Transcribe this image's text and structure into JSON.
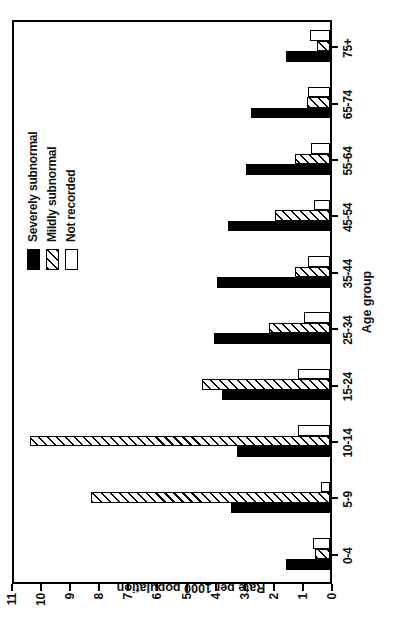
{
  "chart_data": {
    "type": "bar",
    "orientation": "vertical-drawn-rotated",
    "title": "",
    "xlabel": "Age group",
    "ylabel": "Rate per 1000 population",
    "categories": [
      "0-4",
      "5-9",
      "10-14",
      "15-24",
      "25-34",
      "35-44",
      "45-54",
      "55-64",
      "65-74",
      "75+"
    ],
    "ylim": [
      0,
      11
    ],
    "yticks": [
      0,
      1,
      2,
      3,
      4,
      5,
      6,
      7,
      8,
      9,
      10,
      11
    ],
    "ytick_labels": [
      "0",
      "1",
      "2",
      "3",
      "4",
      "5",
      "6",
      "7",
      "8",
      "9",
      "10",
      "11"
    ],
    "grid": false,
    "legend_position": "top-right inside plot",
    "series": [
      {
        "name": "Severely subnormal",
        "fill": "solid-black",
        "color": "#000000",
        "values": [
          1.5,
          3.4,
          3.2,
          3.7,
          4.0,
          3.9,
          3.5,
          2.9,
          2.7,
          1.5
        ]
      },
      {
        "name": "Mildly subnormal",
        "fill": "diagonal-hatch",
        "color": "#ffffff",
        "values": [
          0.5,
          8.2,
          10.3,
          4.4,
          2.1,
          1.2,
          1.9,
          1.2,
          0.8,
          0.45
        ]
      },
      {
        "name": "Not recorded",
        "fill": "white",
        "color": "#ffffff",
        "values": [
          0.6,
          0.3,
          1.1,
          1.1,
          0.9,
          0.75,
          0.55,
          0.65,
          0.75,
          0.7
        ]
      }
    ]
  },
  "legend": {
    "entries": [
      {
        "label": "Severely subnormal",
        "swatch": "solid-black-swatch"
      },
      {
        "label": "Mildly subnormal",
        "swatch": "hatched-swatch"
      },
      {
        "label": "Not recorded",
        "swatch": "white-swatch"
      }
    ]
  }
}
